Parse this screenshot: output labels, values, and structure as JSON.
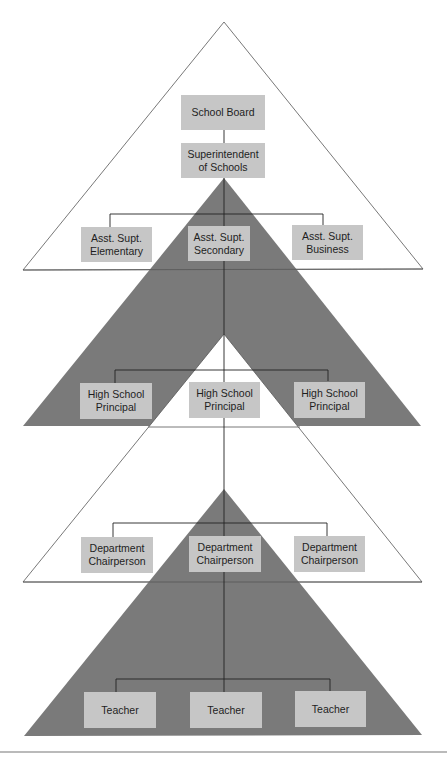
{
  "colors": {
    "dark_triangle": "#7a7a7a",
    "white_triangle": "#ffffff",
    "box_fill": "#c6c6c6",
    "line": "#222222",
    "text": "#1e1e1e"
  },
  "levels": [
    {
      "nodes": [
        {
          "line1": "School Board",
          "line2": ""
        }
      ]
    },
    {
      "nodes": [
        {
          "line1": "Superintendent",
          "line2": "of Schools"
        }
      ]
    },
    {
      "nodes": [
        {
          "line1": "Asst. Supt.",
          "line2": "Elementary"
        },
        {
          "line1": "Asst. Supt.",
          "line2": "Secondary"
        },
        {
          "line1": "Asst. Supt.",
          "line2": "Business"
        }
      ]
    },
    {
      "nodes": [
        {
          "line1": "High School",
          "line2": "Principal"
        },
        {
          "line1": "High School",
          "line2": "Principal"
        },
        {
          "line1": "High School",
          "line2": "Principal"
        }
      ]
    },
    {
      "nodes": [
        {
          "line1": "Department",
          "line2": "Chairperson"
        },
        {
          "line1": "Department",
          "line2": "Chairperson"
        },
        {
          "line1": "Department",
          "line2": "Chairperson"
        }
      ]
    },
    {
      "nodes": [
        {
          "line1": "Teacher",
          "line2": ""
        },
        {
          "line1": "Teacher",
          "line2": ""
        },
        {
          "line1": "Teacher",
          "line2": ""
        }
      ]
    }
  ]
}
